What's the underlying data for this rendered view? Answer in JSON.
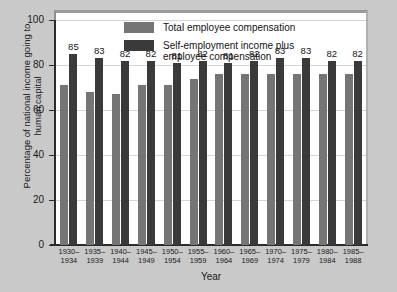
{
  "chart_data": {
    "type": "bar",
    "title": "",
    "xlabel": "Year",
    "ylabel": "Percentage of national income going to human capital",
    "ylim": [
      0,
      100
    ],
    "yticks": [
      0,
      20,
      40,
      60,
      80,
      100
    ],
    "grid": true,
    "legend_position": "top-center",
    "categories": [
      "1930–\n1934",
      "1935–\n1939",
      "1940–\n1944",
      "1945–\n1949",
      "1950–\n1954",
      "1955–\n1959",
      "1960–\n1964",
      "1965–\n1969",
      "1970–\n1974",
      "1975–\n1979",
      "1980–\n1984",
      "1985–\n1988"
    ],
    "series": [
      {
        "name": "Total employee compensation",
        "color": "#757575",
        "values": [
          71,
          68,
          67,
          71,
          71,
          74,
          76,
          76,
          76,
          76,
          76,
          76
        ],
        "labels": [
          "",
          "",
          "",
          "",
          "",
          "",
          "",
          "",
          "",
          "",
          "",
          ""
        ]
      },
      {
        "name": "Self-employment income plus employee compensation",
        "color": "#3a3a3a",
        "values": [
          85,
          83,
          82,
          82,
          81,
          82,
          81,
          82,
          83,
          83,
          82,
          82
        ],
        "labels": [
          "85",
          "83",
          "82",
          "82",
          "81",
          "82",
          "81",
          "82",
          "83",
          "83",
          "82",
          "82"
        ]
      }
    ]
  },
  "legend": {
    "items": [
      {
        "label": "Total employee compensation",
        "swatch": "light"
      },
      {
        "label": "Self-employment income plus\nemployee compensation",
        "swatch": "dark"
      }
    ]
  }
}
